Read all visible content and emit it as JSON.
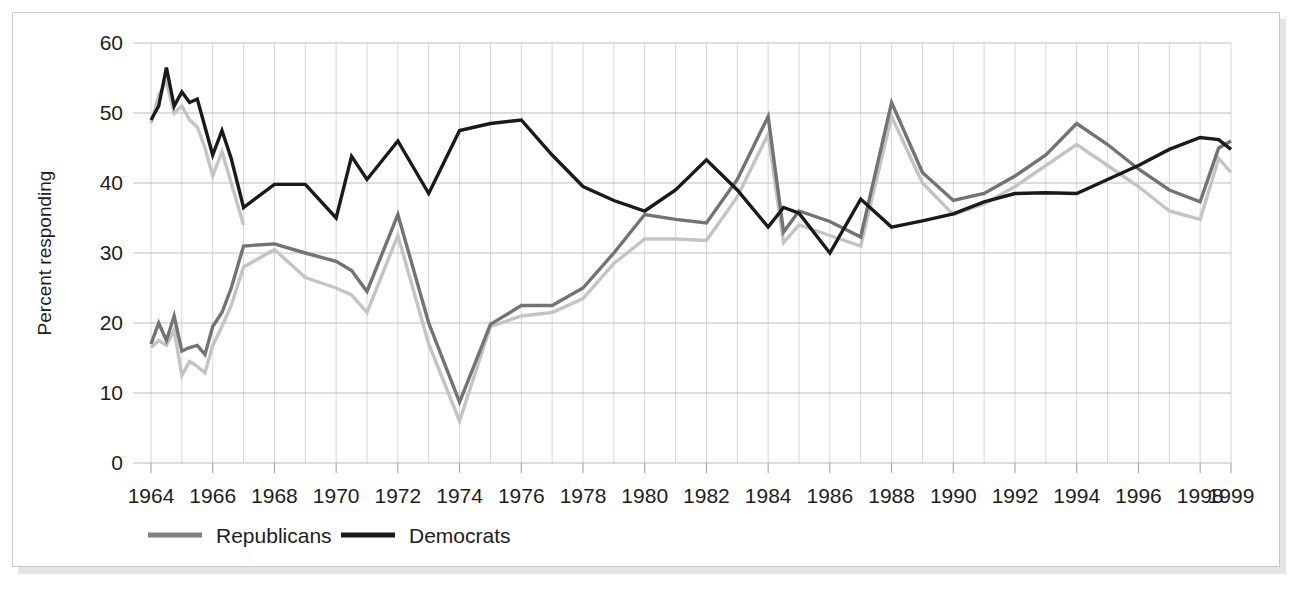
{
  "figure": {
    "border_color": "#c9c9c9",
    "background": "#ffffff"
  },
  "chart_data": {
    "type": "line",
    "title": "",
    "subtitle": "",
    "xlabel": "",
    "ylabel": "Percent responding",
    "xlim": [
      1964,
      1999
    ],
    "ylim": [
      0,
      60
    ],
    "grid": "both-annual-vertical-and-decile-horizontal",
    "legend_position": "below-axis-left",
    "ytick_labels": [
      "0",
      "10",
      "20",
      "30",
      "40",
      "50",
      "60"
    ],
    "ytick_values": [
      0,
      10,
      20,
      30,
      40,
      50,
      60
    ],
    "xtick_labels": [
      "1964",
      "1966",
      "1968",
      "1970",
      "1972",
      "1974",
      "1976",
      "1978",
      "1980",
      "1982",
      "1984",
      "1986",
      "1988",
      "1990",
      "1992",
      "1994",
      "1996",
      "1998",
      "1999"
    ],
    "xtick_values": [
      1964,
      1966,
      1968,
      1970,
      1972,
      1974,
      1976,
      1978,
      1980,
      1982,
      1984,
      1986,
      1988,
      1990,
      1992,
      1994,
      1996,
      1998,
      1999
    ],
    "legend": [
      {
        "name": "Republicans",
        "color": "#808080",
        "swatch": "line"
      },
      {
        "name": "Democrats",
        "color": "#1a1a1a",
        "swatch": "line"
      }
    ],
    "series": [
      {
        "name": "Democrats",
        "color": "#1a1a1a",
        "width": 3.4,
        "x": [
          1964.0,
          1964.25,
          1964.5,
          1964.75,
          1965.0,
          1965.25,
          1965.5,
          1965.75,
          1966.0,
          1966.3,
          1966.6,
          1967.0,
          1968.0,
          1969.0,
          1970.0,
          1970.5,
          1971.0,
          1972.0,
          1973.0,
          1974.0,
          1975.0,
          1976.0,
          1977.0,
          1978.0,
          1979.0,
          1980.0,
          1981.0,
          1982.0,
          1983.0,
          1984.0,
          1984.5,
          1985.0,
          1986.0,
          1987.0,
          1988.0,
          1989.0,
          1990.0,
          1991.0,
          1992.0,
          1993.0,
          1994.0,
          1995.0,
          1996.0,
          1997.0,
          1998.0,
          1998.6,
          1999.0
        ],
        "y": [
          49.0,
          51.0,
          56.5,
          51.0,
          53.0,
          51.5,
          52.0,
          48.0,
          44.0,
          47.5,
          43.5,
          36.5,
          39.8,
          39.8,
          35.0,
          43.8,
          40.5,
          46.0,
          38.5,
          47.5,
          48.5,
          49.0,
          44.0,
          39.5,
          37.5,
          36.0,
          39.0,
          43.3,
          39.0,
          33.7,
          36.5,
          35.7,
          30.0,
          37.7,
          33.7,
          34.6,
          35.6,
          37.3,
          38.5,
          38.6,
          38.5,
          40.5,
          42.5,
          44.8,
          46.5,
          46.2,
          44.8
        ]
      },
      {
        "name": "Republicans (dark)",
        "color": "#737373",
        "width": 3.4,
        "x": [
          1964.0,
          1964.25,
          1964.5,
          1964.75,
          1965.0,
          1965.25,
          1965.5,
          1965.75,
          1966.0,
          1966.3,
          1966.6,
          1967.0,
          1968.0,
          1969.0,
          1970.0,
          1970.5,
          1971.0,
          1972.0,
          1973.0,
          1974.0,
          1975.0,
          1976.0,
          1977.0,
          1978.0,
          1979.0,
          1980.0,
          1981.0,
          1982.0,
          1983.0,
          1984.0,
          1984.5,
          1985.0,
          1986.0,
          1987.0,
          1988.0,
          1989.0,
          1990.0,
          1991.0,
          1992.0,
          1993.0,
          1994.0,
          1995.0,
          1996.0,
          1997.0,
          1998.0,
          1998.6,
          1999.0
        ],
        "y": [
          17.0,
          20.0,
          17.5,
          21.0,
          16.0,
          16.5,
          16.8,
          15.5,
          19.5,
          21.5,
          25.0,
          31.0,
          31.3,
          30.0,
          28.8,
          27.5,
          24.5,
          35.5,
          20.0,
          8.7,
          19.8,
          22.5,
          22.5,
          25.0,
          30.0,
          35.5,
          34.8,
          34.3,
          40.5,
          49.5,
          33.0,
          36.0,
          34.5,
          32.3,
          51.5,
          41.5,
          37.5,
          38.5,
          41.0,
          44.0,
          48.5,
          45.5,
          42.0,
          39.0,
          37.3,
          45.0,
          46.0
        ]
      },
      {
        "name": "Republicans (light)",
        "color": "#c4c4c4",
        "width": 3.4,
        "x": [
          1964.0,
          1964.25,
          1964.5,
          1964.75,
          1965.0,
          1965.25,
          1965.5,
          1965.75,
          1966.0,
          1966.3,
          1966.6,
          1967.0,
          1968.0,
          1969.0,
          1970.0,
          1970.5,
          1971.0,
          1972.0,
          1973.0,
          1974.0,
          1975.0,
          1976.0,
          1977.0,
          1978.0,
          1979.0,
          1980.0,
          1981.0,
          1982.0,
          1983.0,
          1984.0,
          1984.5,
          1985.0,
          1986.0,
          1987.0,
          1988.0,
          1989.0,
          1990.0,
          1991.0,
          1992.0,
          1993.0,
          1994.0,
          1995.0,
          1996.0,
          1997.0,
          1998.0,
          1998.6,
          1999.0
        ],
        "y": [
          16.5,
          17.5,
          16.8,
          19.0,
          12.5,
          14.5,
          13.8,
          12.9,
          16.8,
          19.5,
          22.5,
          28.0,
          30.5,
          26.5,
          25.0,
          24.0,
          21.5,
          32.5,
          17.0,
          6.0,
          19.5,
          21.0,
          21.5,
          23.5,
          28.5,
          32.0,
          32.0,
          31.8,
          38.0,
          47.0,
          31.5,
          34.0,
          32.5,
          31.0,
          49.5,
          40.0,
          35.5,
          37.0,
          39.5,
          42.5,
          45.5,
          42.5,
          39.5,
          36.0,
          34.8,
          43.5,
          41.5
        ]
      },
      {
        "name": "Democrats (light overlay)",
        "color": "#c4c4c4",
        "width": 3.4,
        "x": [
          1964.0,
          1964.25,
          1964.5,
          1964.75,
          1965.0,
          1965.25,
          1965.5,
          1965.75,
          1966.0,
          1966.3,
          1966.6,
          1967.0
        ],
        "y": [
          48.5,
          52.5,
          54.5,
          50.0,
          51.0,
          49.0,
          48.0,
          45.0,
          41.0,
          44.5,
          40.0,
          34.0
        ]
      }
    ]
  },
  "legend_render": {
    "republicans_label": "Republicans",
    "democrats_label": "Democrats"
  }
}
